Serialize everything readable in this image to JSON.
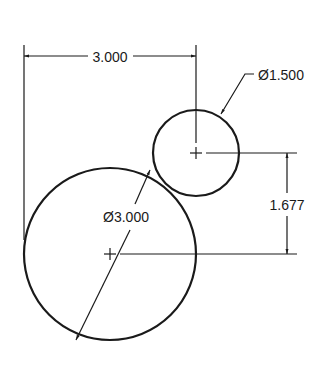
{
  "drawing": {
    "type": "engineering-dimensioned-drawing",
    "line_color": "#1a1a1a",
    "background": "#ffffff",
    "circles": [
      {
        "id": "large-circle",
        "diameter_label": "Ø3.000",
        "cx": 110,
        "cy": 254,
        "r": 86
      },
      {
        "id": "small-circle",
        "diameter_label": "Ø1.500",
        "cx": 196,
        "cy": 153,
        "r": 43
      }
    ],
    "dimensions": {
      "horizontal_distance": {
        "label": "3.000"
      },
      "vertical_distance": {
        "label": "1.677"
      },
      "small_diameter": {
        "label": "Ø1.500"
      },
      "large_diameter": {
        "label": "Ø3.000"
      }
    }
  }
}
